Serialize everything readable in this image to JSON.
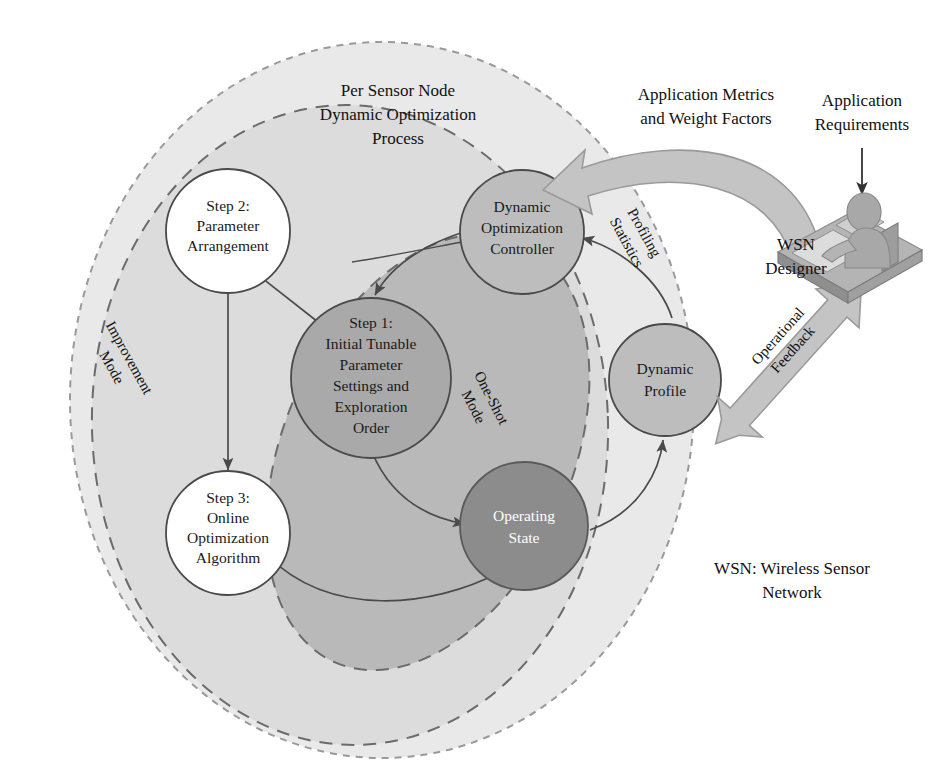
{
  "figure": {
    "title_lines": [
      "Per Sensor Node",
      "Dynamic Optimization",
      "Process"
    ],
    "legend_lines": [
      "WSN: Wireless Sensor",
      "Network"
    ]
  },
  "nodes": {
    "step1": {
      "lines": [
        "Step 1:",
        "Initial Tunable",
        "Parameter",
        "Settings and",
        "Exploration",
        "Order"
      ],
      "fill": "#a9a9a9",
      "text_color": "#1a1a1a"
    },
    "step2": {
      "lines": [
        "Step 2:",
        "Parameter",
        "Arrangement"
      ],
      "fill": "#ffffff",
      "text_color": "#1a1a1a"
    },
    "step3": {
      "lines": [
        "Step 3:",
        "Online",
        "Optimization",
        "Algorithm"
      ],
      "fill": "#ffffff",
      "text_color": "#1a1a1a"
    },
    "controller": {
      "lines": [
        "Dynamic",
        "Optimization",
        "Controller"
      ],
      "fill": "#bdbdbd",
      "text_color": "#1a1a1a"
    },
    "profile": {
      "lines": [
        "Dynamic",
        "Profile"
      ],
      "fill": "#bdbdbd",
      "text_color": "#1a1a1a"
    },
    "operating_state": {
      "lines": [
        "Operating",
        "State"
      ],
      "fill": "#8c8c8c",
      "text_color": "#ffffff"
    }
  },
  "regions": {
    "outer": {
      "label_lines": [
        "Per Sensor Node",
        "Dynamic Optimization",
        "Process"
      ],
      "fill": "#e9e9e9"
    },
    "improvement": {
      "label_lines": [
        "Improvement",
        "Mode"
      ],
      "fill": "#dcdcdc"
    },
    "oneshot": {
      "label_lines": [
        "One-Shot",
        "Mode"
      ],
      "fill": "#b9b9b9"
    }
  },
  "edge_labels": {
    "profiling": {
      "lines": [
        "Profiling",
        "Statistics"
      ]
    },
    "app_metrics": {
      "lines": [
        "Application Metrics",
        "and Weight Factors"
      ]
    },
    "app_requirements": {
      "lines": [
        "Application",
        "Requirements"
      ]
    },
    "operational_feedback": {
      "lines": [
        "Operational",
        "Feedback"
      ]
    }
  },
  "actor": {
    "label_lines": [
      "WSN",
      "Designer"
    ],
    "icon": "person-at-computer-icon",
    "color": "#9a9a9a"
  },
  "colors": {
    "stroke": "#4a4a4a",
    "dashed_stroke": "#8a8a8a",
    "block_arrow_fill": "#c4c4c4",
    "background": "#ffffff"
  }
}
